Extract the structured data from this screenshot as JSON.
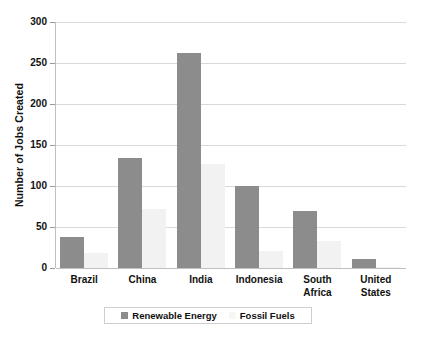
{
  "chart_data": {
    "type": "bar",
    "title": "",
    "xlabel": "",
    "ylabel": "Number of Jobs Created",
    "ylim": [
      0,
      300
    ],
    "yticks": [
      0,
      50,
      100,
      150,
      200,
      250,
      300
    ],
    "ytick_labels": [
      "0",
      "50",
      "100",
      "150",
      "200",
      "250",
      "300"
    ],
    "grid": true,
    "legend_position": "bottom",
    "categories": [
      "Brazil",
      "China",
      "India",
      "Indonesia",
      "South Africa",
      "United States"
    ],
    "series": [
      {
        "name": "Renewable Energy",
        "color": "#8c8c8c",
        "values": [
          38,
          134,
          262,
          100,
          70,
          11
        ]
      },
      {
        "name": "Fossil Fuels",
        "color": "#f2f2f2",
        "values": [
          18,
          72,
          127,
          21,
          33,
          1
        ]
      }
    ]
  },
  "legend": {
    "items": [
      {
        "label": "Renewable Energy",
        "swatch": "#8c8c8c"
      },
      {
        "label": "Fossil Fuels",
        "swatch": "#f7f7f7"
      }
    ]
  },
  "colors": {
    "renewable": "#8c8c8c",
    "fossil": "#f2f2f2",
    "gridline": "#d9d9d9",
    "axis": "#bfbfbf",
    "text": "#111111",
    "background": "#ffffff"
  }
}
